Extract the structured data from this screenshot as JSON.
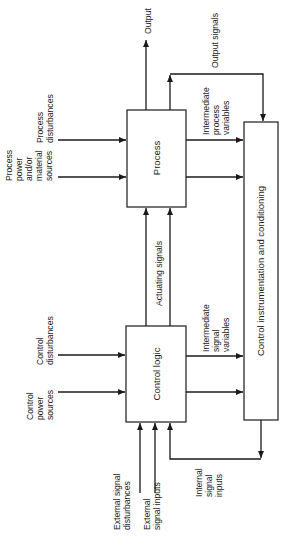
{
  "diagram": {
    "type": "block-diagram",
    "orientation": "rotated-90-ccw",
    "blocks": {
      "process": "Process",
      "control_logic": "Control logic",
      "instrumentation": "Control instrumentation and conditioning"
    },
    "labels": {
      "output": "Output",
      "output_signals": "Output signals",
      "intermediate_process_variables": [
        "Intermediate",
        "process",
        "variables"
      ],
      "process_disturbances": [
        "Process",
        "disturbances"
      ],
      "process_power": [
        "Process",
        "power",
        "and/or",
        "material",
        "sources"
      ],
      "actuating_signals": "Actuating signals",
      "control_disturbances": [
        "Control",
        "disturbances"
      ],
      "control_power": [
        "Control",
        "power",
        "sources"
      ],
      "intermediate_signal_variables": [
        "Intermediate",
        "signal",
        "variables"
      ],
      "external_signal_disturbances": [
        "External signal",
        "disturbances"
      ],
      "external_signal_inputs": [
        "External",
        "signal inputs"
      ],
      "internal_signal_inputs": [
        "Internal",
        "signal",
        "inputs"
      ]
    },
    "colors": {
      "ink": "#1a1a1a",
      "background": "#ffffff"
    }
  }
}
